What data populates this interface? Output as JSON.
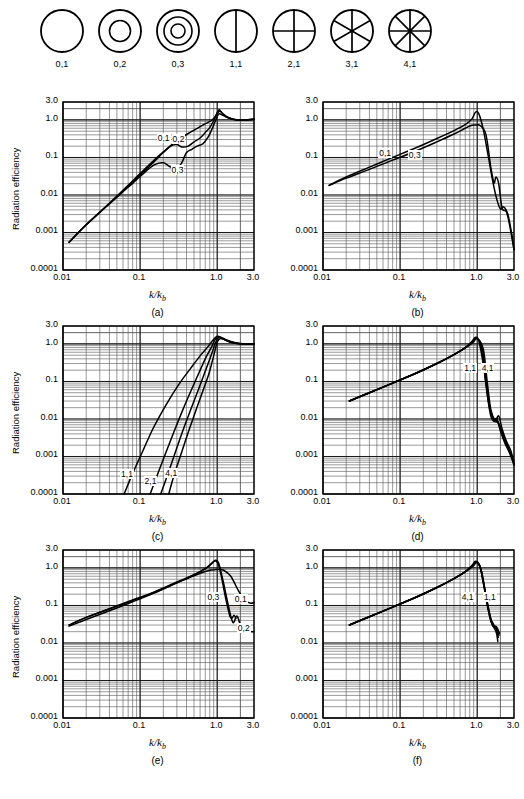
{
  "modes": [
    {
      "id": "0,1",
      "label": "0,1",
      "rings": 0,
      "diameters": 0
    },
    {
      "id": "0,2",
      "label": "0,2",
      "rings": 1,
      "diameters": 0
    },
    {
      "id": "0,3",
      "label": "0,3",
      "rings": 2,
      "diameters": 0
    },
    {
      "id": "1,1",
      "label": "1,1",
      "rings": 0,
      "diameters": 1
    },
    {
      "id": "2,1",
      "label": "2,1",
      "rings": 0,
      "diameters": 2
    },
    {
      "id": "3,1",
      "label": "3,1",
      "rings": 0,
      "diameters": 3
    },
    {
      "id": "4,1",
      "label": "4,1",
      "rings": 0,
      "diameters": 4
    }
  ],
  "axes": {
    "y_title": "Radiation efficiency",
    "y_ticks": [
      "3.0",
      "1.0",
      "0.1",
      "0.01",
      "0.001",
      "0.0001"
    ],
    "y_tick_values": [
      3.0,
      1.0,
      0.1,
      0.01,
      0.001,
      0.0001
    ],
    "x_ticks": [
      "0.01",
      "0.1",
      "1.0",
      "3.0"
    ],
    "x_tick_values": [
      0.01,
      0.1,
      1.0,
      3.0
    ],
    "x_title_main": "k/k",
    "x_title_sub": "b",
    "xlim": [
      0.01,
      3.0
    ],
    "ylim": [
      0.0001,
      3.0
    ],
    "xscale": "log",
    "yscale": "log",
    "grid": "log-minor-both"
  },
  "panels": [
    {
      "caption": "(a)",
      "curve_labels": [
        {
          "text": "0,1",
          "x": 0.215,
          "y": 0.3
        },
        {
          "text": "0,2",
          "x": 0.335,
          "y": 0.27
        },
        {
          "text": "0,3",
          "x": 0.325,
          "y": 0.042
        }
      ]
    },
    {
      "caption": "(b)",
      "curve_labels": [
        {
          "text": "0,1",
          "x": 0.068,
          "y": 0.115
        },
        {
          "text": "0,3",
          "x": 0.165,
          "y": 0.105
        }
      ]
    },
    {
      "caption": "(c)",
      "curve_labels": [
        {
          "text": "1,1",
          "x": 0.072,
          "y": 0.00031
        },
        {
          "text": "2,1",
          "x": 0.145,
          "y": 0.0002
        },
        {
          "text": "4,1",
          "x": 0.27,
          "y": 0.00032
        }
      ]
    },
    {
      "caption": "(d)",
      "curve_labels": [
        {
          "text": "1,1",
          "x": 0.86,
          "y": 0.2
        },
        {
          "text": "4,1",
          "x": 1.45,
          "y": 0.2
        }
      ]
    },
    {
      "caption": "(e)",
      "curve_labels": [
        {
          "text": "0,3",
          "x": 0.95,
          "y": 0.145
        },
        {
          "text": "0,1",
          "x": 2.15,
          "y": 0.135
        },
        {
          "text": "0,2",
          "x": 2.35,
          "y": 0.022
        }
      ]
    },
    {
      "caption": "(f)",
      "curve_labels": [
        {
          "text": "4,1",
          "x": 0.8,
          "y": 0.145
        },
        {
          "text": "1,1",
          "x": 1.55,
          "y": 0.145
        }
      ]
    }
  ],
  "chart_data": [
    {
      "type": "line",
      "panel": "(a)",
      "title": "",
      "xlabel": "k/k_b",
      "ylabel": "Radiation efficiency",
      "xscale": "log",
      "yscale": "log",
      "xlim": [
        0.01,
        3.0
      ],
      "ylim": [
        0.0001,
        3.0
      ],
      "grid": true,
      "series": [
        {
          "name": "0,1",
          "x": [
            0.012,
            0.02,
            0.04,
            0.07,
            0.1,
            0.15,
            0.2,
            0.3,
            0.45,
            0.6,
            0.75,
            0.85,
            0.95,
            1.05,
            1.15,
            1.4,
            1.8,
            2.3,
            3.0
          ],
          "y": [
            0.00055,
            0.0016,
            0.006,
            0.018,
            0.037,
            0.082,
            0.14,
            0.28,
            0.47,
            0.66,
            0.85,
            0.98,
            1.25,
            1.85,
            1.55,
            1.15,
            0.98,
            1.0,
            1.05
          ]
        },
        {
          "name": "0,2",
          "x": [
            0.012,
            0.02,
            0.04,
            0.07,
            0.1,
            0.15,
            0.2,
            0.25,
            0.3,
            0.35,
            0.42,
            0.5,
            0.6,
            0.7,
            0.8,
            0.9,
            1.0,
            1.1,
            1.3,
            1.8,
            2.3,
            3.0
          ],
          "y": [
            0.00055,
            0.0016,
            0.0059,
            0.017,
            0.034,
            0.075,
            0.135,
            0.2,
            0.22,
            0.19,
            0.2,
            0.26,
            0.33,
            0.46,
            0.62,
            0.95,
            1.5,
            1.7,
            1.2,
            1.0,
            1.0,
            1.05
          ]
        },
        {
          "name": "0,3",
          "x": [
            0.012,
            0.02,
            0.04,
            0.07,
            0.1,
            0.15,
            0.2,
            0.25,
            0.3,
            0.35,
            0.4,
            0.47,
            0.55,
            0.65,
            0.75,
            0.85,
            0.95,
            1.05,
            1.2,
            1.6,
            2.2,
            3.0
          ],
          "y": [
            0.00055,
            0.0016,
            0.0058,
            0.016,
            0.031,
            0.062,
            0.072,
            0.055,
            0.051,
            0.075,
            0.135,
            0.165,
            0.2,
            0.23,
            0.33,
            0.55,
            0.95,
            1.45,
            1.3,
            1.05,
            1.0,
            1.02
          ]
        }
      ]
    },
    {
      "type": "line",
      "panel": "(b)",
      "xlabel": "k/k_b",
      "ylabel": "Radiation efficiency",
      "xscale": "log",
      "yscale": "log",
      "xlim": [
        0.01,
        3.0
      ],
      "ylim": [
        0.0001,
        3.0
      ],
      "grid": true,
      "series": [
        {
          "name": "0,1",
          "x": [
            0.012,
            0.02,
            0.04,
            0.08,
            0.15,
            0.3,
            0.5,
            0.7,
            0.85,
            0.95,
            1.05,
            1.2,
            1.4,
            1.6,
            1.8,
            2.0,
            2.2,
            2.5,
            2.8,
            3.0
          ],
          "y": [
            0.018,
            0.03,
            0.055,
            0.1,
            0.17,
            0.32,
            0.52,
            0.75,
            1.05,
            1.6,
            1.45,
            0.55,
            0.1,
            0.022,
            0.0075,
            0.0042,
            0.0048,
            0.003,
            0.0009,
            0.00035
          ]
        },
        {
          "name": "0,3",
          "x": [
            0.012,
            0.02,
            0.04,
            0.08,
            0.15,
            0.3,
            0.5,
            0.7,
            0.85,
            0.95,
            1.1,
            1.3,
            1.5,
            1.65,
            1.75,
            1.9,
            2.1,
            2.4,
            2.7,
            3.0
          ],
          "y": [
            0.018,
            0.028,
            0.048,
            0.085,
            0.14,
            0.26,
            0.42,
            0.6,
            0.72,
            0.73,
            0.7,
            0.4,
            0.055,
            0.021,
            0.03,
            0.02,
            0.0045,
            0.0035,
            0.0012,
            0.00035
          ]
        }
      ]
    },
    {
      "type": "line",
      "panel": "(c)",
      "xlabel": "k/k_b",
      "ylabel": "Radiation efficiency",
      "xscale": "log",
      "yscale": "log",
      "xlim": [
        0.01,
        3.0
      ],
      "ylim": [
        0.0001,
        3.0
      ],
      "grid": true,
      "series": [
        {
          "name": "1,1",
          "x": [
            0.062,
            0.08,
            0.11,
            0.15,
            0.22,
            0.32,
            0.45,
            0.6,
            0.75,
            0.88,
            1.0,
            1.15,
            1.4,
            1.8,
            2.3,
            3.0
          ],
          "y": [
            0.0001,
            0.00035,
            0.0015,
            0.006,
            0.025,
            0.085,
            0.22,
            0.48,
            0.82,
            1.25,
            1.6,
            1.45,
            1.15,
            1.02,
            1.0,
            1.0
          ]
        },
        {
          "name": "2,1",
          "x": [
            0.135,
            0.17,
            0.22,
            0.28,
            0.36,
            0.46,
            0.58,
            0.72,
            0.85,
            0.95,
            1.1,
            1.35,
            1.8,
            2.3,
            3.0
          ],
          "y": [
            0.0001,
            0.00035,
            0.0014,
            0.005,
            0.018,
            0.058,
            0.17,
            0.45,
            0.85,
            1.35,
            1.5,
            1.25,
            1.05,
            1.0,
            1.0
          ]
        },
        {
          "name": "3,1",
          "x": [
            0.185,
            0.23,
            0.29,
            0.36,
            0.45,
            0.56,
            0.68,
            0.82,
            0.93,
            1.03,
            1.2,
            1.5,
            2.0,
            2.5,
            3.0
          ],
          "y": [
            0.0001,
            0.00035,
            0.0014,
            0.005,
            0.017,
            0.055,
            0.16,
            0.45,
            0.95,
            1.45,
            1.35,
            1.12,
            1.02,
            1.0,
            1.0
          ]
        },
        {
          "name": "4,1",
          "x": [
            0.235,
            0.28,
            0.35,
            0.43,
            0.53,
            0.65,
            0.78,
            0.9,
            1.0,
            1.1,
            1.3,
            1.6,
            2.1,
            2.6,
            3.0
          ],
          "y": [
            0.0001,
            0.00035,
            0.0014,
            0.005,
            0.017,
            0.055,
            0.16,
            0.48,
            1.1,
            1.4,
            1.25,
            1.08,
            1.0,
            1.0,
            1.0
          ]
        }
      ]
    },
    {
      "type": "line",
      "panel": "(d)",
      "xlabel": "k/k_b",
      "ylabel": "Radiation efficiency",
      "xscale": "log",
      "yscale": "log",
      "xlim": [
        0.01,
        3.0
      ],
      "ylim": [
        0.0001,
        3.0
      ],
      "grid": true,
      "series": [
        {
          "name": "1,1",
          "x": [
            0.022,
            0.04,
            0.08,
            0.15,
            0.3,
            0.5,
            0.7,
            0.85,
            0.95,
            1.05,
            1.2,
            1.35,
            1.5,
            1.7,
            1.9,
            2.1,
            2.4,
            2.7,
            3.0
          ],
          "y": [
            0.03,
            0.05,
            0.09,
            0.155,
            0.3,
            0.52,
            0.8,
            1.15,
            1.5,
            1.2,
            0.28,
            0.045,
            0.012,
            0.0085,
            0.012,
            0.0055,
            0.0025,
            0.0015,
            0.0007
          ]
        },
        {
          "name": "2,1",
          "x": [
            0.022,
            0.04,
            0.08,
            0.15,
            0.3,
            0.5,
            0.7,
            0.85,
            0.95,
            1.1,
            1.25,
            1.4,
            1.6,
            1.8,
            2.0,
            2.3,
            2.6,
            3.0
          ],
          "y": [
            0.03,
            0.05,
            0.09,
            0.155,
            0.3,
            0.52,
            0.8,
            1.12,
            1.45,
            1.0,
            0.17,
            0.028,
            0.01,
            0.01,
            0.0048,
            0.0022,
            0.0013,
            0.0006
          ]
        },
        {
          "name": "3,1",
          "x": [
            0.022,
            0.04,
            0.08,
            0.15,
            0.3,
            0.5,
            0.7,
            0.85,
            0.98,
            1.15,
            1.3,
            1.45,
            1.65,
            1.85,
            2.1,
            2.4,
            2.8,
            3.0
          ],
          "y": [
            0.03,
            0.05,
            0.09,
            0.155,
            0.3,
            0.52,
            0.78,
            1.1,
            1.42,
            0.85,
            0.12,
            0.022,
            0.0095,
            0.0085,
            0.004,
            0.002,
            0.001,
            0.0006
          ]
        },
        {
          "name": "4,1",
          "x": [
            0.022,
            0.04,
            0.08,
            0.15,
            0.3,
            0.5,
            0.7,
            0.88,
            1.0,
            1.2,
            1.35,
            1.5,
            1.7,
            1.9,
            2.2,
            2.5,
            2.9,
            3.0
          ],
          "y": [
            0.03,
            0.05,
            0.09,
            0.155,
            0.3,
            0.52,
            0.78,
            1.08,
            1.38,
            0.72,
            0.095,
            0.018,
            0.009,
            0.0075,
            0.0035,
            0.0018,
            0.0008,
            0.0006
          ]
        }
      ]
    },
    {
      "type": "line",
      "panel": "(e)",
      "xlabel": "k/k_b",
      "ylabel": "Radiation efficiency",
      "xscale": "log",
      "yscale": "log",
      "xlim": [
        0.01,
        3.0
      ],
      "ylim": [
        0.0001,
        3.0
      ],
      "grid": true,
      "series": [
        {
          "name": "0,1",
          "x": [
            0.012,
            0.02,
            0.04,
            0.08,
            0.15,
            0.3,
            0.5,
            0.7,
            0.85,
            0.95,
            1.05,
            1.2,
            1.5,
            1.9,
            2.3,
            2.7,
            3.0
          ],
          "y": [
            0.03,
            0.048,
            0.08,
            0.135,
            0.22,
            0.4,
            0.62,
            0.8,
            0.88,
            0.9,
            0.9,
            0.88,
            0.6,
            0.24,
            0.135,
            0.115,
            0.12
          ]
        },
        {
          "name": "0,2",
          "x": [
            0.012,
            0.02,
            0.04,
            0.08,
            0.15,
            0.3,
            0.5,
            0.7,
            0.85,
            0.95,
            1.05,
            1.2,
            1.4,
            1.6,
            1.8,
            2.0,
            2.2,
            2.5,
            3.0
          ],
          "y": [
            0.028,
            0.042,
            0.072,
            0.125,
            0.21,
            0.4,
            0.65,
            0.95,
            1.35,
            1.6,
            1.3,
            0.42,
            0.095,
            0.035,
            0.052,
            0.03,
            0.021,
            0.02,
            0.02
          ]
        },
        {
          "name": "0,3",
          "x": [
            0.012,
            0.02,
            0.04,
            0.08,
            0.15,
            0.3,
            0.5,
            0.7,
            0.85,
            0.95,
            1.05,
            1.15,
            1.3,
            1.45,
            1.55,
            1.65,
            1.75
          ],
          "y": [
            0.03,
            0.048,
            0.082,
            0.14,
            0.225,
            0.42,
            0.66,
            0.95,
            1.3,
            1.55,
            1.15,
            0.5,
            0.14,
            0.055,
            0.045,
            0.055,
            0.045
          ]
        }
      ]
    },
    {
      "type": "line",
      "panel": "(f)",
      "xlabel": "k/k_b",
      "ylabel": "Radiation efficiency",
      "xscale": "log",
      "yscale": "log",
      "xlim": [
        0.01,
        3.0
      ],
      "ylim": [
        0.0001,
        3.0
      ],
      "grid": true,
      "series": [
        {
          "name": "1,1",
          "x": [
            0.022,
            0.04,
            0.08,
            0.15,
            0.3,
            0.5,
            0.7,
            0.85,
            0.95,
            1.08,
            1.2,
            1.35,
            1.5,
            1.65,
            1.8,
            1.95
          ],
          "y": [
            0.03,
            0.05,
            0.09,
            0.155,
            0.3,
            0.52,
            0.8,
            1.15,
            1.5,
            1.15,
            0.42,
            0.12,
            0.045,
            0.03,
            0.026,
            0.018
          ]
        },
        {
          "name": "2,1",
          "x": [
            0.022,
            0.04,
            0.08,
            0.15,
            0.3,
            0.5,
            0.7,
            0.85,
            0.97,
            1.1,
            1.22,
            1.35,
            1.5,
            1.65,
            1.8,
            1.92
          ],
          "y": [
            0.03,
            0.05,
            0.09,
            0.155,
            0.3,
            0.52,
            0.8,
            1.12,
            1.45,
            1.0,
            0.33,
            0.1,
            0.04,
            0.028,
            0.024,
            0.016
          ]
        },
        {
          "name": "3,1",
          "x": [
            0.022,
            0.04,
            0.08,
            0.15,
            0.3,
            0.5,
            0.7,
            0.85,
            0.99,
            1.12,
            1.25,
            1.38,
            1.52,
            1.66,
            1.78,
            1.88
          ],
          "y": [
            0.03,
            0.05,
            0.09,
            0.155,
            0.3,
            0.52,
            0.78,
            1.1,
            1.42,
            0.88,
            0.27,
            0.085,
            0.036,
            0.026,
            0.022,
            0.014
          ]
        },
        {
          "name": "4,1",
          "x": [
            0.022,
            0.04,
            0.08,
            0.15,
            0.3,
            0.5,
            0.7,
            0.87,
            1.0,
            1.14,
            1.28,
            1.42,
            1.55,
            1.68,
            1.78,
            1.85
          ],
          "y": [
            0.03,
            0.05,
            0.09,
            0.155,
            0.3,
            0.52,
            0.78,
            1.08,
            1.38,
            0.78,
            0.22,
            0.072,
            0.032,
            0.024,
            0.018,
            0.011
          ]
        }
      ]
    }
  ]
}
